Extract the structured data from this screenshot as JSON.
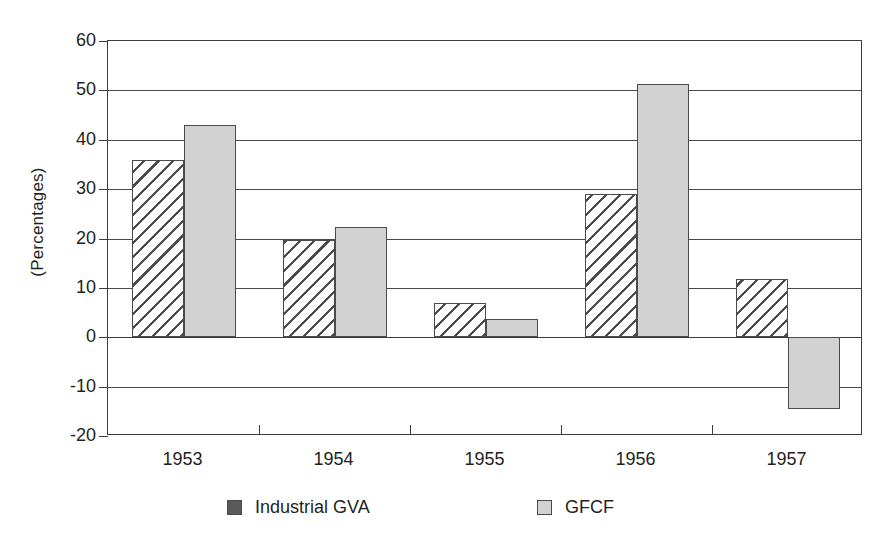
{
  "chart_data": {
    "type": "bar",
    "title": "",
    "subtitle": "",
    "xlabel": "",
    "ylabel": "(Percentages)",
    "categories": [
      "1953",
      "1954",
      "1955",
      "1956",
      "1957"
    ],
    "series": [
      {
        "name": "Industrial GVA",
        "values": [
          35.8,
          19.6,
          6.9,
          29.0,
          11.8
        ],
        "swatch_color": "#5a5a5a",
        "fill": "diagonal-hatch"
      },
      {
        "name": "GFCF",
        "values": [
          43.0,
          22.3,
          3.6,
          51.3,
          -14.5
        ],
        "swatch_color": "#d2d2d2",
        "fill": "solid-light-gray"
      }
    ],
    "ylim": [
      -20,
      60
    ],
    "ytick_labels": [
      "60",
      "50",
      "40",
      "30",
      "20",
      "10",
      "0",
      "-10",
      "-20"
    ],
    "ytick_values": [
      60,
      50,
      40,
      30,
      20,
      10,
      0,
      -10,
      -20
    ],
    "grid": "horizontal",
    "legend_position": "bottom",
    "axis_color": "#3c3c3c",
    "bar_border_color": "#4b4b4b",
    "background_color": "#ffffff"
  }
}
